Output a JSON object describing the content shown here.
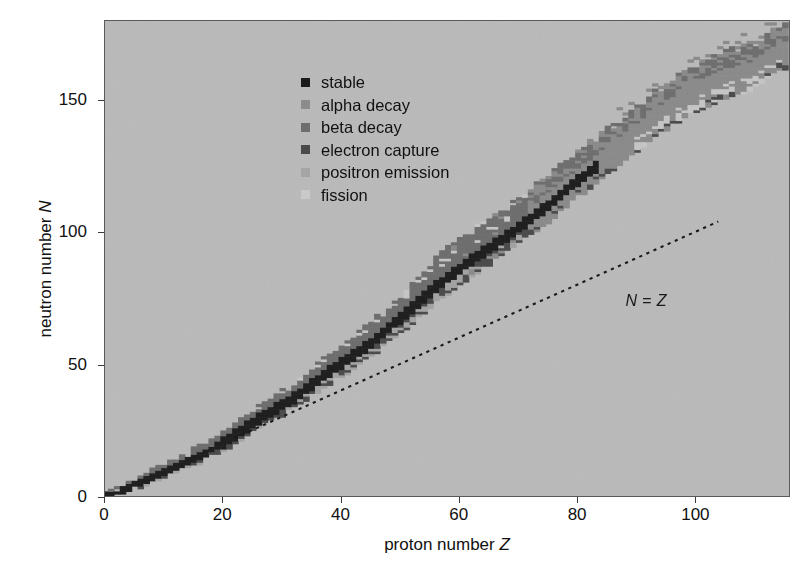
{
  "chart_data": {
    "type": "scatter",
    "title": "",
    "subtitle": "",
    "xlabel": "proton number Z",
    "ylabel": "neutron number N",
    "xlabel_plain": "proton number",
    "xlabel_symbol": "Z",
    "ylabel_plain": "neutron number",
    "ylabel_symbol": "N",
    "xlim": [
      0,
      116
    ],
    "ylim": [
      0,
      180
    ],
    "xticks": [
      0,
      20,
      40,
      60,
      80,
      100
    ],
    "yticks": [
      0,
      50,
      100,
      150
    ],
    "grid": false,
    "legend_position": "upper left",
    "annotations": [
      {
        "name": "n-equals-z-line",
        "text": "N = Z",
        "symbol_left": "N",
        "operator": " = ",
        "symbol_right": "Z",
        "style": "dotted",
        "x_from": 22,
        "y_from": 22,
        "x_to": 104,
        "y_to": 104,
        "label_x": 88,
        "label_y": 74,
        "color": "#1a1a1a"
      }
    ],
    "background_color": "#bdbdbd",
    "frame_color": "#5a5a5a",
    "series": [
      {
        "name": "stable",
        "label": "stable",
        "color": "#1b1b1b",
        "count": 253
      },
      {
        "name": "alpha-decay",
        "label": "alpha decay",
        "color": "#8c8c8c",
        "count": 700
      },
      {
        "name": "beta-decay",
        "label": "beta decay",
        "color": "#6e6e6e",
        "count": 1200
      },
      {
        "name": "electron-capture",
        "label": "electron capture",
        "color": "#4a4a4a",
        "count": 650
      },
      {
        "name": "positron-emission",
        "label": "positron emission",
        "color": "#a5a5a5",
        "count": 600
      },
      {
        "name": "fission",
        "label": "fission",
        "color": "#c9c9c9",
        "count": 120
      }
    ],
    "cell_size_z": 1,
    "cell_size_n": 1,
    "valley_of_stability": {
      "description": "N approx Z for light nuclei, curving to N approx 1.5*Z for heavy nuclei",
      "anchor_points": [
        {
          "z": 0,
          "n": 1
        },
        {
          "z": 2,
          "n": 2
        },
        {
          "z": 6,
          "n": 6
        },
        {
          "z": 10,
          "n": 10
        },
        {
          "z": 16,
          "n": 16
        },
        {
          "z": 20,
          "n": 21
        },
        {
          "z": 26,
          "n": 30
        },
        {
          "z": 32,
          "n": 38
        },
        {
          "z": 38,
          "n": 48
        },
        {
          "z": 44,
          "n": 57
        },
        {
          "z": 50,
          "n": 68
        },
        {
          "z": 56,
          "n": 80
        },
        {
          "z": 62,
          "n": 90
        },
        {
          "z": 68,
          "n": 99
        },
        {
          "z": 74,
          "n": 109
        },
        {
          "z": 80,
          "n": 120
        },
        {
          "z": 86,
          "n": 130
        },
        {
          "z": 92,
          "n": 141
        },
        {
          "z": 98,
          "n": 150
        },
        {
          "z": 104,
          "n": 157
        },
        {
          "z": 110,
          "n": 161
        },
        {
          "z": 114,
          "n": 168
        }
      ]
    },
    "band_widths": {
      "stable_half_width": 1.1,
      "neutron_rich_extent": 9.0,
      "proton_rich_extent": 6.5,
      "alpha_region_min_z": 72,
      "fission_region_min_z": 90
    }
  },
  "legend": {
    "items": [
      {
        "label": "stable",
        "color": "#1b1b1b",
        "icon": "square-marker-icon"
      },
      {
        "label": "alpha decay",
        "color": "#8c8c8c",
        "icon": "square-marker-icon"
      },
      {
        "label": "beta decay",
        "color": "#6e6e6e",
        "icon": "square-marker-icon"
      },
      {
        "label": "electron capture",
        "color": "#4a4a4a",
        "icon": "square-marker-icon"
      },
      {
        "label": "positron emission",
        "color": "#a5a5a5",
        "icon": "square-marker-icon"
      },
      {
        "label": "fission",
        "color": "#c9c9c9",
        "icon": "square-marker-icon"
      }
    ]
  },
  "axes": {
    "x": {
      "title_plain": "proton number",
      "title_symbol": "Z",
      "tick_labels": [
        "0",
        "20",
        "40",
        "60",
        "80",
        "100"
      ],
      "tick_values": [
        0,
        20,
        40,
        60,
        80,
        100
      ]
    },
    "y": {
      "title_plain": "neutron number",
      "title_symbol": "N",
      "tick_labels": [
        "0",
        "50",
        "100",
        "150"
      ],
      "tick_values": [
        0,
        50,
        100,
        150
      ]
    }
  }
}
